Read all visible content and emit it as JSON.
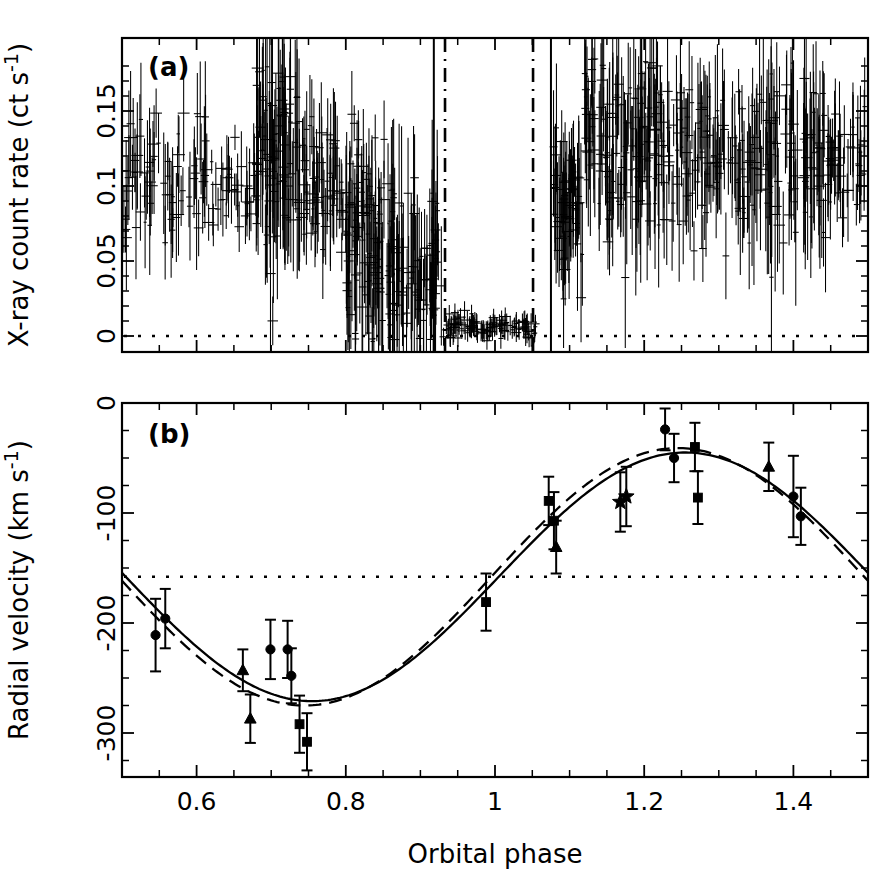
{
  "figure": {
    "xlabel": "Orbital phase",
    "background": "#ffffff",
    "ink": "#000000"
  },
  "panel_a": {
    "label": "(a)",
    "ylabel": "X-ray count rate (ct s",
    "ylabel_exp": "-1",
    "ylabel_close": ")",
    "yticklabels": [
      "0",
      "0.05",
      "0.1",
      "0.15"
    ],
    "xticklabels": [
      "0.6",
      "0.8",
      "1",
      "1.2",
      "1.4"
    ]
  },
  "panel_b": {
    "label": "(b)",
    "ylabel": "Radial velocity (km s",
    "ylabel_exp": "-1",
    "ylabel_close": ")",
    "yticklabels": [
      "0",
      "-100",
      "-200",
      "-300"
    ],
    "xticklabels": [
      "0.6",
      "0.8",
      "1",
      "1.2",
      "1.4"
    ]
  },
  "chart_data": [
    {
      "type": "scatter",
      "panel": "a",
      "title": "(a) X-ray light curve",
      "xlabel": "Orbital phase",
      "ylabel": "X-ray count rate (ct s^-1)",
      "xlim": [
        0.5,
        1.5
      ],
      "ylim": [
        -0.012,
        0.185
      ],
      "xticks": [
        0.6,
        0.8,
        1.0,
        1.2,
        1.4
      ],
      "yticks": [
        0,
        0.05,
        0.1,
        0.15
      ],
      "grid": false,
      "legend": "none",
      "reference_lines": [
        {
          "kind": "horizontal",
          "y": 0,
          "style": "dotted",
          "label": "zero count rate"
        }
      ],
      "vertical_markers": [
        {
          "x": 0.918,
          "style": "solid",
          "label": "eclipse ingress (solid)"
        },
        {
          "x": 0.933,
          "style": "dash-dot",
          "label": "eclipse ingress (dash-dot)"
        },
        {
          "x": 1.051,
          "style": "dash-dot",
          "label": "eclipse egress (dash-dot)"
        },
        {
          "x": 1.075,
          "style": "solid",
          "label": "eclipse egress (solid)"
        }
      ],
      "series": [
        {
          "name": "ASCA/ROSAT count rate",
          "marker": "errorbar-cross",
          "description": "Dense X-ray light curve with deep eclipse between phase ~0.93 and ~1.06",
          "segments": [
            {
              "phase_range": [
                0.5,
                0.62
              ],
              "mean_rate": 0.105,
              "scatter": 0.022,
              "n": 70
            },
            {
              "phase_range": [
                0.62,
                0.68
              ],
              "mean_rate": 0.095,
              "scatter": 0.015,
              "n": 35
            },
            {
              "phase_range": [
                0.68,
                0.74
              ],
              "mean_rate": 0.122,
              "scatter": 0.032,
              "n": 95
            },
            {
              "phase_range": [
                0.74,
                0.79
              ],
              "mean_rate": 0.1,
              "scatter": 0.022,
              "n": 55
            },
            {
              "phase_range": [
                0.79,
                0.86
              ],
              "mean_rate": 0.094,
              "scatter": 0.018,
              "n": 50
            },
            {
              "phase_range": [
                0.8,
                0.93
              ],
              "mean_rate": 0.045,
              "scatter": 0.03,
              "n": 150
            },
            {
              "phase_range": [
                0.93,
                1.055
              ],
              "mean_rate": 0.006,
              "scatter": 0.004,
              "n": 110
            },
            {
              "phase_range": [
                1.075,
                1.12
              ],
              "mean_rate": 0.085,
              "scatter": 0.025,
              "n": 60
            },
            {
              "phase_range": [
                1.12,
                1.22
              ],
              "mean_rate": 0.125,
              "scatter": 0.03,
              "n": 130
            },
            {
              "phase_range": [
                1.22,
                1.34
              ],
              "mean_rate": 0.118,
              "scatter": 0.025,
              "n": 110
            },
            {
              "phase_range": [
                1.34,
                1.44
              ],
              "mean_rate": 0.124,
              "scatter": 0.03,
              "n": 100
            },
            {
              "phase_range": [
                1.44,
                1.5
              ],
              "mean_rate": 0.12,
              "scatter": 0.022,
              "n": 45
            }
          ]
        }
      ]
    },
    {
      "type": "scatter",
      "panel": "b",
      "title": "(b) Radial velocity curve",
      "xlabel": "Orbital phase",
      "ylabel": "Radial velocity (km s^-1)",
      "xlim": [
        0.5,
        1.5
      ],
      "ylim": [
        -340,
        0
      ],
      "xticks": [
        0.6,
        0.8,
        1.0,
        1.2,
        1.4
      ],
      "yticks": [
        0,
        -100,
        -200,
        -300
      ],
      "grid": false,
      "legend": "none",
      "reference_lines": [
        {
          "kind": "horizontal",
          "y": -158,
          "style": "dotted",
          "label": "systemic velocity"
        }
      ],
      "fits": [
        {
          "name": "circular orbit fit",
          "style": "solid",
          "gamma": -158,
          "K": 113,
          "phase0": 1.255
        },
        {
          "name": "eccentric orbit fit",
          "style": "dashed",
          "gamma": -158,
          "K": 117,
          "phase0": 1.245
        }
      ],
      "points": [
        {
          "phase": 0.545,
          "rv": -211,
          "err": 33,
          "marker": "circle"
        },
        {
          "phase": 0.558,
          "rv": -196,
          "err": 27,
          "marker": "circle"
        },
        {
          "phase": 0.662,
          "rv": -243,
          "err": 19,
          "marker": "triangle"
        },
        {
          "phase": 0.672,
          "rv": -287,
          "err": 22,
          "marker": "triangle"
        },
        {
          "phase": 0.699,
          "rv": -224,
          "err": 27,
          "marker": "circle"
        },
        {
          "phase": 0.722,
          "rv": -224,
          "err": 26,
          "marker": "circle"
        },
        {
          "phase": 0.727,
          "rv": -248,
          "err": 25,
          "marker": "circle"
        },
        {
          "phase": 0.738,
          "rv": -292,
          "err": 26,
          "marker": "square"
        },
        {
          "phase": 0.748,
          "rv": -308,
          "err": 26,
          "marker": "square"
        },
        {
          "phase": 0.988,
          "rv": -181,
          "err": 26,
          "marker": "square"
        },
        {
          "phase": 1.072,
          "rv": -89,
          "err": 22,
          "marker": "square"
        },
        {
          "phase": 1.079,
          "rv": -107,
          "err": 26,
          "marker": "square"
        },
        {
          "phase": 1.082,
          "rv": -131,
          "err": 24,
          "marker": "triangle"
        },
        {
          "phase": 1.168,
          "rv": -90,
          "err": 27,
          "marker": "star"
        },
        {
          "phase": 1.176,
          "rv": -85,
          "err": 27,
          "marker": "star"
        },
        {
          "phase": 1.228,
          "rv": -24,
          "err": 19,
          "marker": "circle"
        },
        {
          "phase": 1.24,
          "rv": -50,
          "err": 22,
          "marker": "circle"
        },
        {
          "phase": 1.268,
          "rv": -40,
          "err": 22,
          "marker": "square"
        },
        {
          "phase": 1.272,
          "rv": -86,
          "err": 24,
          "marker": "square"
        },
        {
          "phase": 1.367,
          "rv": -58,
          "err": 22,
          "marker": "triangle"
        },
        {
          "phase": 1.4,
          "rv": -85,
          "err": 37,
          "marker": "circle"
        },
        {
          "phase": 1.41,
          "rv": -103,
          "err": 26,
          "marker": "circle"
        }
      ]
    }
  ]
}
